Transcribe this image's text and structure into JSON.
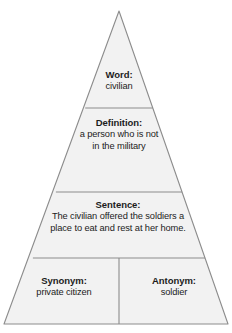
{
  "diagram": {
    "type": "vocabulary-pyramid",
    "shape": "triangle",
    "fill_color": "#f2f2f2",
    "stroke_color": "#8c8c8c",
    "text_color": "#1c1c1c",
    "background_color": "#ffffff",
    "tiers": [
      {
        "id": "word",
        "title": "Word:",
        "body": "civilian"
      },
      {
        "id": "definition",
        "title": "Definition:",
        "body": "a person who is not\nin the military",
        "line1": "a person who is not",
        "line2": "in the military"
      },
      {
        "id": "sentence",
        "title": "Sentence:",
        "body": "The civilian offered the soldiers a\nplace to eat and rest at her home.",
        "line1": "The civilian offered the soldiers a",
        "line2": "place to eat and rest at her home."
      },
      {
        "id": "synonym",
        "title": "Synonym:",
        "body": "private citizen"
      },
      {
        "id": "antonym",
        "title": "Antonym:",
        "body": "soldier"
      }
    ]
  }
}
